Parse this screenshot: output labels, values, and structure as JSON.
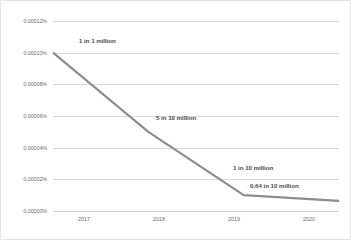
{
  "chart_data": {
    "type": "line",
    "title": "",
    "xlabel": "",
    "ylabel": "",
    "categories": [
      "2017",
      "2018",
      "2019",
      "2020"
    ],
    "x": [
      2017,
      2018,
      2019,
      2020
    ],
    "values": [
      0.0001,
      5e-05,
      1e-05,
      6.4e-06
    ],
    "point_labels": [
      "1 in 1 million",
      "5 in 10 million",
      "1 in 10 million",
      "0.64 in 10 million"
    ],
    "ylim": [
      0.0,
      0.00012
    ],
    "yticks": [
      0.0,
      2e-05,
      4e-05,
      6e-05,
      8e-05,
      0.0001,
      0.00012
    ],
    "ytick_labels": [
      "0.00000%",
      "0.00002%",
      "0.00004%",
      "0.00006%",
      "0.00008%",
      "0.00010%",
      "0.00012%"
    ],
    "xtick_labels": [
      "2017",
      "2018",
      "2019",
      "2020"
    ],
    "grid": true,
    "legend": false,
    "series_color": "#8c8c8c",
    "gridline_color": "#d9d9d9",
    "tick_label_color": "#6d6d6d",
    "data_label_color": "#4a4a4a"
  }
}
